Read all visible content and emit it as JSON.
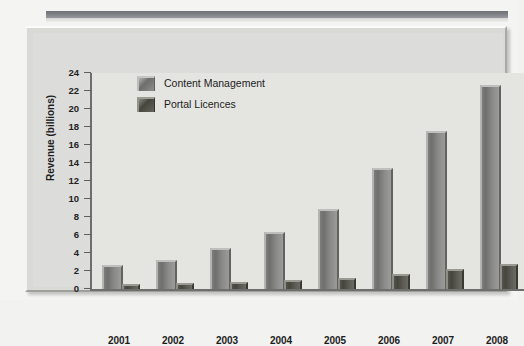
{
  "chart_data": {
    "type": "bar",
    "title": "",
    "xlabel": "",
    "ylabel": "Revenue (billions)",
    "categories": [
      "2001",
      "2002",
      "2003",
      "2004",
      "2005",
      "2006",
      "2007",
      "2008"
    ],
    "series": [
      {
        "name": "Content Management",
        "values": [
          2.4,
          3.0,
          4.3,
          6.1,
          8.7,
          13.2,
          17.3,
          22.5
        ],
        "color": "#7d7d7b"
      },
      {
        "name": "Portal Licences",
        "values": [
          0.3,
          0.5,
          0.6,
          0.8,
          1.0,
          1.4,
          2.0,
          2.6
        ],
        "color": "#4a4a43"
      }
    ],
    "ylim": [
      0,
      24
    ],
    "ytick_labels": [
      "0",
      "2",
      "4",
      "6",
      "8",
      "10",
      "12",
      "14",
      "16",
      "18",
      "20",
      "22",
      "24"
    ],
    "ytick_values": [
      0,
      2,
      4,
      6,
      8,
      10,
      12,
      14,
      16,
      18,
      20,
      22,
      24
    ],
    "grid": false,
    "legend_position": "top-left-inside",
    "plot_background": "#e4e4e1",
    "panel_background": "#dcdcda"
  }
}
